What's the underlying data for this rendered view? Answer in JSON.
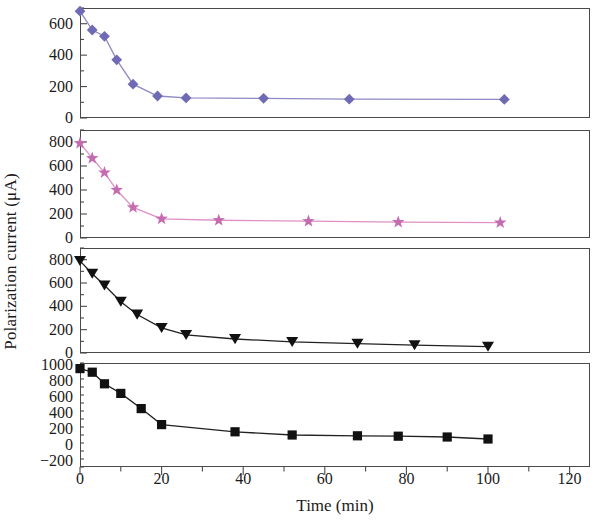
{
  "chart_data": {
    "type": "line",
    "title": "",
    "xlabel": "Time (min)",
    "ylabel": "Polarization current (μA)",
    "xlim": [
      0,
      125
    ],
    "xticks": [
      0,
      20,
      40,
      60,
      80,
      100,
      120
    ],
    "grid": false,
    "legend": "none",
    "panels": [
      {
        "index": 1,
        "name": "panel-diamond",
        "marker": "diamond",
        "color": "#6f6ab5",
        "line_color": "#8d89c6",
        "ylim": [
          0,
          700
        ],
        "yticks": [
          0,
          200,
          400,
          600
        ],
        "x": [
          0,
          3,
          6,
          9,
          13,
          19,
          26,
          45,
          66,
          104
        ],
        "y": [
          680,
          560,
          520,
          370,
          215,
          140,
          128,
          125,
          120,
          118
        ]
      },
      {
        "index": 2,
        "name": "panel-star",
        "marker": "star",
        "color": "#c56cb0",
        "line_color": "#e090c6",
        "ylim": [
          0,
          900
        ],
        "yticks": [
          0,
          200,
          400,
          600,
          800
        ],
        "x": [
          0,
          3,
          6,
          9,
          13,
          20,
          34,
          56,
          78,
          103
        ],
        "y": [
          790,
          665,
          545,
          400,
          255,
          160,
          148,
          140,
          132,
          128
        ]
      },
      {
        "index": 3,
        "name": "panel-triangle-down",
        "marker": "triangle-down",
        "color": "#111111",
        "line_color": "#222222",
        "ylim": [
          0,
          900
        ],
        "yticks": [
          0,
          200,
          400,
          600,
          800
        ],
        "x": [
          0,
          3,
          6,
          10,
          14,
          20,
          26,
          38,
          52,
          68,
          82,
          100
        ],
        "y": [
          790,
          680,
          580,
          440,
          330,
          215,
          155,
          120,
          95,
          80,
          68,
          55
        ]
      },
      {
        "index": 4,
        "name": "panel-square",
        "marker": "square",
        "color": "#111111",
        "line_color": "#222222",
        "ylim": [
          -280,
          1020
        ],
        "yticks": [
          -200,
          0,
          200,
          400,
          600,
          800,
          1000
        ],
        "x": [
          0,
          3,
          6,
          10,
          15,
          20,
          38,
          52,
          68,
          78,
          90,
          100
        ],
        "y": [
          950,
          905,
          760,
          640,
          450,
          250,
          160,
          120,
          110,
          105,
          95,
          70
        ]
      }
    ]
  },
  "axis_text": {
    "y_title": "Polarization current (μA)",
    "x_title": "Time (min)"
  }
}
